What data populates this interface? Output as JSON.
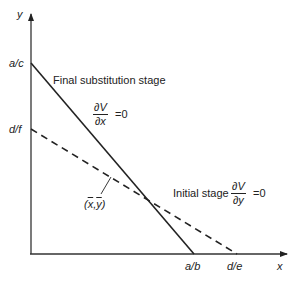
{
  "diagram": {
    "axes": {
      "x_label": "x",
      "y_label": "y"
    },
    "y_intercepts": {
      "solid": "a/c",
      "dashed": "d/f"
    },
    "x_intercepts": {
      "solid": "a/b",
      "dashed": "d/e"
    },
    "solid_line": {
      "caption": "Final substitution stage",
      "condition_numerator": "∂V",
      "condition_denominator": "∂x",
      "condition_rhs": "=0",
      "style": "solid"
    },
    "dashed_line": {
      "caption": "Initial stage",
      "condition_numerator": "∂V",
      "condition_denominator": "∂y",
      "condition_rhs": "=0",
      "style": "dashed"
    },
    "intersection": {
      "label_open": "(",
      "x_sym": "x",
      "comma": ",",
      "y_sym": "y",
      "label_close": ")"
    },
    "colors": {
      "line": "#222222",
      "background": "#ffffff"
    }
  }
}
